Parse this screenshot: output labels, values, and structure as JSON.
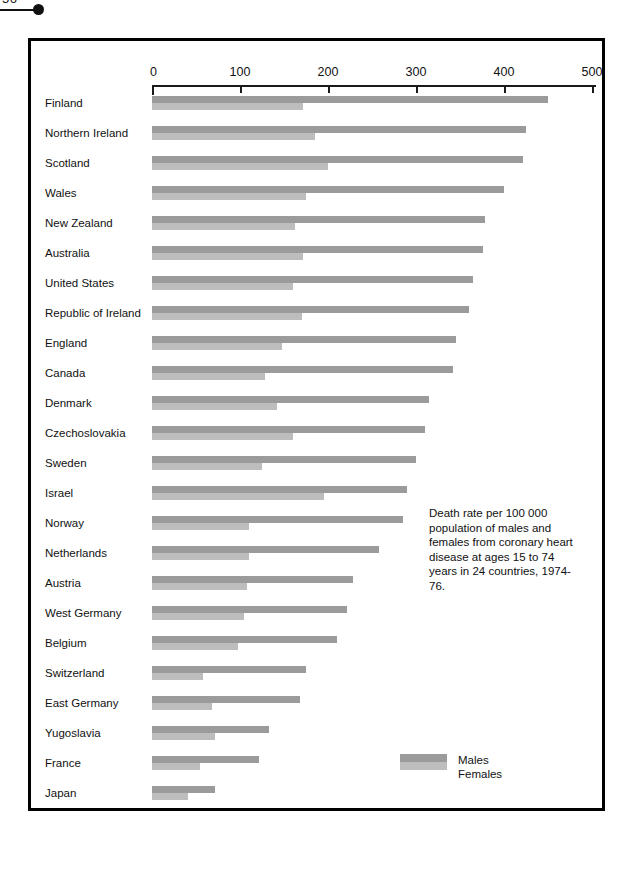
{
  "page_marker": {
    "number": "56"
  },
  "caption": "Death rate per 100 000 population of males and females from coronary heart disease at ages 15 to 74 years in 24 countries, 1974-76.",
  "legend": {
    "males_label": "Males",
    "females_label": "Females",
    "males_color": "#9b9b9b",
    "females_color": "#bdbdbd"
  },
  "chart_data": {
    "type": "bar",
    "orientation": "horizontal",
    "title": "Death rate per 100 000 population of males and females from coronary heart disease at ages 15 to 74 years in 24 countries, 1974-76.",
    "xlabel": "",
    "ylabel": "",
    "xlim": [
      0,
      500
    ],
    "xticks": [
      0,
      100,
      200,
      300,
      400,
      500
    ],
    "xtick_labels": [
      "0",
      "100",
      "200",
      "300",
      "400",
      "500"
    ],
    "grid": false,
    "legend_position": "bottom-right",
    "categories": [
      "Finland",
      "Northern Ireland",
      "Scotland",
      "Wales",
      "New Zealand",
      "Australia",
      "United States",
      "Republic of Ireland",
      "England",
      "Canada",
      "Denmark",
      "Czechoslovakia",
      "Sweden",
      "Israel",
      "Norway",
      "Netherlands",
      "Austria",
      "West Germany",
      "Belgium",
      "Switzerland",
      "East Germany",
      "Yugoslavia",
      "France",
      "Japan"
    ],
    "series": [
      {
        "name": "Males",
        "color": "#9b9b9b",
        "values": [
          450,
          425,
          422,
          400,
          378,
          376,
          365,
          360,
          345,
          342,
          315,
          310,
          300,
          290,
          285,
          258,
          228,
          222,
          210,
          175,
          168,
          133,
          122,
          72
        ]
      },
      {
        "name": "Females",
        "color": "#bdbdbd",
        "values": [
          172,
          185,
          200,
          175,
          162,
          172,
          160,
          170,
          148,
          128,
          142,
          160,
          125,
          195,
          110,
          110,
          108,
          105,
          98,
          58,
          68,
          72,
          55,
          41
        ]
      }
    ]
  }
}
